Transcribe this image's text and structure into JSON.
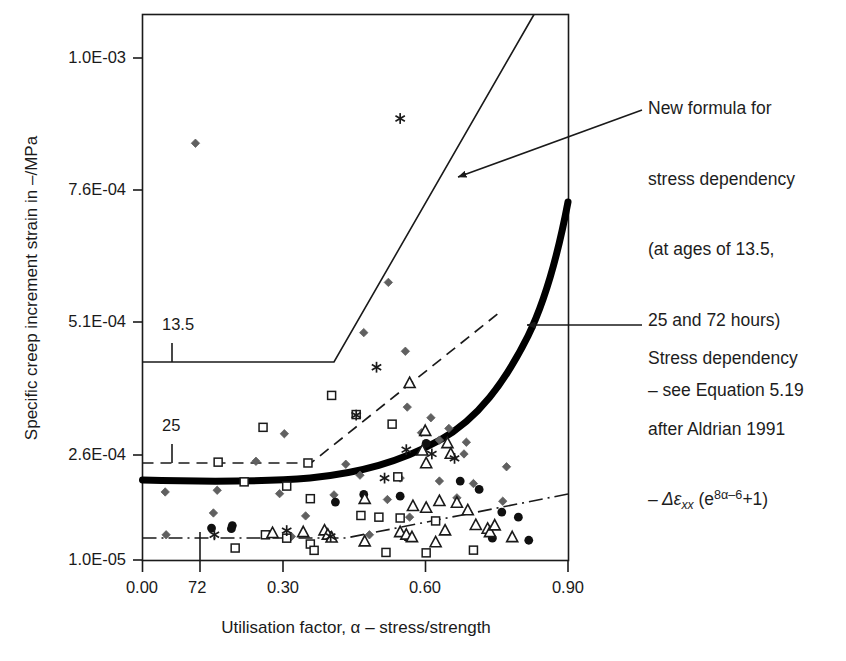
{
  "chart_data": {
    "type": "scatter",
    "title": "",
    "xlabel": "Utilisation factor, α – stress/strength",
    "ylabel": "Specific creep increment strain in –/MPa",
    "xlim": [
      0.0,
      0.9
    ],
    "ylim": [
      1e-05,
      0.001
    ],
    "grid": false,
    "legend_position": "none",
    "x_ticks": [
      "0.00",
      "0.30",
      "0.60",
      "0.90"
    ],
    "x_tick_values": [
      0.0,
      0.3,
      0.6,
      0.9
    ],
    "y_ticks": [
      "1.0E-05",
      "2.6E-04",
      "5.1E-04",
      "7.6E-04",
      "1.0E-03"
    ],
    "y_tick_values": [
      1e-05,
      0.00026,
      0.00051,
      0.00076,
      0.001
    ],
    "curve_labels": [
      {
        "text": "13.5",
        "x": 0.075,
        "y": 0.000395,
        "note": "solid new-formula curve, age 13.5 hours"
      },
      {
        "text": "25",
        "x": 0.075,
        "y": 0.000215,
        "note": "dashed new-formula curve, age 25 hours"
      },
      {
        "text": "72",
        "x": 0.105,
        "y": 1e-05,
        "note": "dash-dot new-formula curve, age 72 hours"
      }
    ],
    "series": [
      {
        "name": "new formula 13.5 h",
        "style": "solid",
        "color": "#1a1a1a",
        "points": [
          [
            0.0,
            0.000368
          ],
          [
            0.405,
            0.000368
          ],
          [
            0.735,
            0.001035
          ]
        ]
      },
      {
        "name": "new formula 25 h",
        "style": "dashed",
        "color": "#1a1a1a",
        "points": [
          [
            0.0,
            0.000201
          ],
          [
            0.355,
            0.000201
          ],
          [
            0.755,
            0.000515
          ]
        ]
      },
      {
        "name": "new formula 72 h",
        "style": "dash-dot",
        "color": "#1a1a1a",
        "points": [
          [
            0.0,
            4.65e-05
          ],
          [
            0.43,
            4.65e-05
          ],
          [
            0.9,
            0.00013
          ]
        ]
      },
      {
        "name": "Stress dependency after Aldrian 1991",
        "style": "thick-solid",
        "color": "#000000",
        "points": [
          [
            0.0,
            0.000163
          ],
          [
            0.1,
            0.000161
          ],
          [
            0.2,
            0.00016
          ],
          [
            0.3,
            0.000162
          ],
          [
            0.4,
            0.00017
          ],
          [
            0.5,
            0.000184
          ],
          [
            0.58,
            0.000202
          ],
          [
            0.66,
            0.000234
          ],
          [
            0.72,
            0.000276
          ],
          [
            0.78,
            0.00035
          ],
          [
            0.84,
            0.00047
          ],
          [
            0.9,
            0.000627
          ]
        ]
      },
      {
        "name": "measurements diamond",
        "style": "marker",
        "marker": "diamond",
        "color": "#606060",
        "points": [
          [
            0.112,
            0.000845
          ],
          [
            0.52,
            0.000585
          ],
          [
            0.468,
            0.00049
          ],
          [
            0.556,
            0.000455
          ],
          [
            0.56,
            0.00035
          ],
          [
            0.61,
            0.00033
          ],
          [
            0.648,
            0.00031
          ],
          [
            0.59,
            0.000302
          ],
          [
            0.3,
            0.0003
          ],
          [
            0.628,
            0.000288
          ],
          [
            0.685,
            0.000284
          ],
          [
            0.68,
            0.000262
          ],
          [
            0.24,
            0.000245
          ],
          [
            0.43,
            0.000238
          ],
          [
            0.77,
            0.000232
          ],
          [
            0.46,
            0.000212
          ],
          [
            0.545,
            0.000205
          ],
          [
            0.628,
            0.000198
          ],
          [
            0.7,
            0.000192
          ],
          [
            0.158,
            0.000176
          ],
          [
            0.048,
            0.000172
          ],
          [
            0.29,
            0.000168
          ],
          [
            0.405,
            0.000165
          ],
          [
            0.665,
            0.000158
          ],
          [
            0.518,
            0.000154
          ],
          [
            0.762,
            0.00015
          ],
          [
            0.15,
            0.000122
          ],
          [
            0.345,
            0.000115
          ],
          [
            0.565,
            0.000112
          ],
          [
            0.05,
            7e-05
          ],
          [
            0.315,
            6.6e-05
          ],
          [
            0.48,
            7e-05
          ]
        ]
      },
      {
        "name": "measurements square",
        "style": "marker",
        "marker": "square-open",
        "color": "#1a1a1a",
        "points": [
          [
            0.4,
            0.000372
          ],
          [
            0.452,
            0.000336
          ],
          [
            0.528,
            0.000318
          ],
          [
            0.255,
            0.000312
          ],
          [
            0.16,
            0.000243
          ],
          [
            0.35,
            0.000241
          ],
          [
            0.54,
            0.000208
          ],
          [
            0.215,
            0.000196
          ],
          [
            0.305,
            0.000186
          ],
          [
            0.355,
            0.000156
          ],
          [
            0.462,
            0.000116
          ],
          [
            0.5,
            0.000112
          ],
          [
            0.545,
            0.00011
          ],
          [
            0.62,
            0.000103
          ],
          [
            0.26,
            7e-05
          ],
          [
            0.305,
            6.2e-05
          ],
          [
            0.196,
            3.85e-05
          ],
          [
            0.355,
            4.8e-05
          ],
          [
            0.363,
            3.3e-05
          ],
          [
            0.515,
            2.8e-05
          ],
          [
            0.6,
            2.7e-05
          ],
          [
            0.7,
            3.35e-05
          ]
        ]
      },
      {
        "name": "measurements circle",
        "style": "marker",
        "marker": "circle-filled",
        "color": "#101010",
        "points": [
          [
            0.6,
            0.000282
          ],
          [
            0.672,
            0.000198
          ],
          [
            0.712,
            0.000178
          ],
          [
            0.468,
            0.000166
          ],
          [
            0.545,
            0.000162
          ],
          [
            0.76,
            0.000124
          ],
          [
            0.795,
            0.000112
          ],
          [
            0.408,
            0.000148
          ],
          [
            0.146,
            8.6e-05
          ],
          [
            0.19,
            9.2e-05
          ],
          [
            0.188,
            8.45e-05
          ],
          [
            0.56,
            6.4e-05
          ],
          [
            0.74,
            6.2e-05
          ],
          [
            0.817,
            5.7e-05
          ]
        ]
      },
      {
        "name": "measurements triangle",
        "style": "marker",
        "marker": "triangle-open",
        "color": "#1a1a1a",
        "points": [
          [
            0.565,
            0.000395
          ],
          [
            0.598,
            0.000305
          ],
          [
            0.645,
            0.000282
          ],
          [
            0.592,
            0.000268
          ],
          [
            0.652,
            0.000262
          ],
          [
            0.6,
            0.00024
          ],
          [
            0.47,
            0.000155
          ],
          [
            0.628,
            0.00015
          ],
          [
            0.665,
            0.000146
          ],
          [
            0.572,
            0.000138
          ],
          [
            0.6,
            0.000134
          ],
          [
            0.688,
            0.000128
          ],
          [
            0.275,
            7.4e-05
          ],
          [
            0.34,
            7.6e-05
          ],
          [
            0.385,
            8e-05
          ],
          [
            0.392,
            7e-05
          ],
          [
            0.4,
            6.3e-05
          ],
          [
            0.545,
            7.6e-05
          ],
          [
            0.558,
            7e-05
          ],
          [
            0.57,
            6.4e-05
          ],
          [
            0.64,
            8e-05
          ],
          [
            0.705,
            9.3e-05
          ],
          [
            0.73,
            8.4e-05
          ],
          [
            0.735,
            7.6e-05
          ],
          [
            0.745,
            9.2e-05
          ],
          [
            0.782,
            6.4e-05
          ],
          [
            0.62,
            5.2e-05
          ],
          [
            0.47,
            5.4e-05
          ]
        ]
      },
      {
        "name": "measurements asterisk",
        "style": "marker",
        "marker": "asterisk",
        "color": "#1a1a1a",
        "points": [
          [
            0.545,
            0.00089
          ],
          [
            0.495,
            0.000425
          ],
          [
            0.452,
            0.000335
          ],
          [
            0.558,
            0.00027
          ],
          [
            0.612,
            0.000262
          ],
          [
            0.66,
            0.000252
          ],
          [
            0.512,
            0.000205
          ],
          [
            0.305,
            8e-05
          ],
          [
            0.398,
            6.6e-05
          ],
          [
            0.152,
            7e-05
          ]
        ]
      }
    ],
    "annotations": [
      {
        "id": "new-formula",
        "lines": [
          "New formula for",
          "stress dependency",
          "(at ages of 13.5,",
          "25 and 72 hours)",
          "– see Equation 5.19"
        ],
        "arrow": "points left-down to solid 13.5 curve"
      },
      {
        "id": "aldrian",
        "lines": [
          "Stress dependency",
          "after Aldrian 1991"
        ],
        "formula_prefix": "– Δε",
        "formula_sub": "xx",
        "formula_open": " (e",
        "formula_sup": "8α–6",
        "formula_close": "+1)",
        "arrow": "points left to thick Aldrian curve"
      }
    ]
  },
  "figure": {
    "background": "#ffffff",
    "axis_color": "#1a1a1a",
    "marker_gray": "#606060",
    "accent": "#000000"
  }
}
